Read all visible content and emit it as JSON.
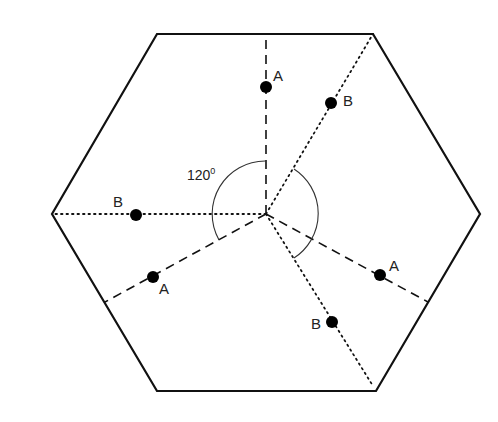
{
  "diagram": {
    "title": "",
    "angle_label": "120°",
    "angle_value": "120",
    "angle_unit": "0",
    "point_labels": {
      "a_top": "A",
      "b_upper_right": "B",
      "b_left": "B",
      "a_lower_left": "A",
      "a_right": "A",
      "b_bottom": "B"
    },
    "line_styles": {
      "A": "dashed",
      "B": "dotted"
    },
    "colors": {
      "stroke": "#111111",
      "fill": "#000000",
      "background": "#ffffff"
    }
  }
}
